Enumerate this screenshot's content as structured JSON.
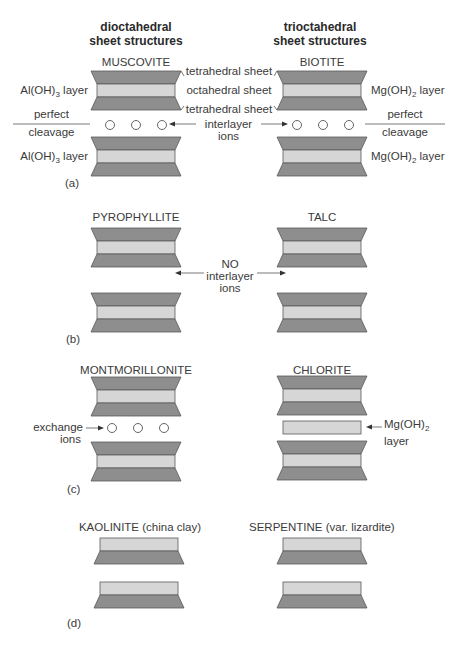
{
  "headers": {
    "left": [
      "dioctahedral",
      "sheet structures"
    ],
    "right": [
      "trioctahedral",
      "sheet structures"
    ]
  },
  "panels": {
    "a": {
      "label": "(a)",
      "left_mineral": "MUSCOVITE",
      "right_mineral": "BIOTITE",
      "sheet_labels": [
        "tetrahedral sheet",
        "octahedral sheet",
        "tetrahedral sheet"
      ],
      "interlayer_label": [
        "interlayer",
        "ions"
      ],
      "left_layer_label": "Al(OH)",
      "left_layer_sub": "3",
      "left_layer_suffix": " layer",
      "right_layer_label": "Mg(OH)",
      "right_layer_sub": "2",
      "right_layer_suffix": " layer",
      "cleavage_label": [
        "perfect",
        "cleavage"
      ]
    },
    "b": {
      "label": "(b)",
      "left_mineral": "PYROPHYLLITE",
      "right_mineral": "TALC",
      "interlayer_label": [
        "NO",
        "interlayer",
        "ions"
      ]
    },
    "c": {
      "label": "(c)",
      "left_mineral": "MONTMORILLONITE",
      "right_mineral": "CHLORITE",
      "exchange_label": [
        "exchange",
        "ions"
      ],
      "mg_layer_label": "Mg(OH)",
      "mg_layer_sub": "2",
      "mg_layer_line2": "layer"
    },
    "d": {
      "label": "(d)",
      "left_mineral": "KAOLINITE (china clay)",
      "right_mineral": "SERPENTINE (var. lizardite)"
    }
  },
  "colors": {
    "tetrahedral": "#8e8e8e",
    "octahedral": "#d6d6d6",
    "outline": "#5a5a5a"
  }
}
